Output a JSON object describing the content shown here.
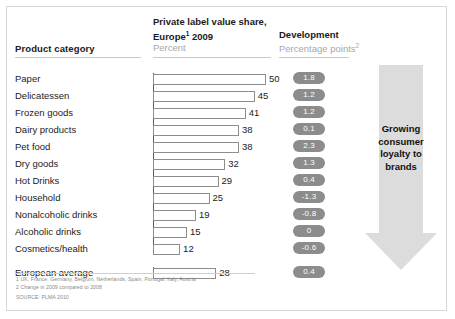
{
  "header": {
    "category_label": "Product category",
    "share_title": "Private label value share,\nEurope",
    "share_title_line1": "Private label value share,",
    "share_title_line2": "Europe",
    "share_title_sup": "1",
    "share_title_year": " 2009",
    "share_subtitle": "Percent",
    "development_title": "Development",
    "development_subtitle": "Percentage points",
    "development_sup": "2"
  },
  "arrow": {
    "label": "Growing consumer loyalty to brands",
    "line1": "Growing",
    "line2": "consumer",
    "line3": "loyalty to",
    "line4": "brands",
    "color": "#dcdcdc"
  },
  "footnotes": {
    "note1": "1 UK, France, Germany, Belgium, Netherlands, Spain, Portugal, Italy, Austria",
    "note2": "2 Change in 2009 compared to 2008",
    "source": "SOURCE: PLMA 2010"
  },
  "style": {
    "pill_color": "#8c8c8c",
    "pill_text_color": "#ffffff",
    "bar_border_color": "#8d8d8d",
    "frame_border_color": "#d8d8d8"
  },
  "chart_data": {
    "type": "bar",
    "xlabel": "Percent",
    "ylabel": "Product category",
    "xlim": [
      0,
      50
    ],
    "grid": false,
    "legend": "none",
    "orientation": "horizontal",
    "categories": [
      "Paper",
      "Delicatessen",
      "Frozen goods",
      "Dairy products",
      "Pet food",
      "Dry goods",
      "Hot Drinks",
      "Household",
      "Nonalcoholic drinks",
      "Alcoholic drinks",
      "Cosmetics/health",
      "European average"
    ],
    "values": [
      50,
      45,
      41,
      38,
      38,
      32,
      29,
      25,
      19,
      15,
      12,
      28
    ],
    "series": [
      {
        "name": "Private label value share, Europe 2009 (Percent)",
        "values": [
          50,
          45,
          41,
          38,
          38,
          32,
          29,
          25,
          19,
          15,
          12,
          28
        ]
      },
      {
        "name": "Development (Percentage points)",
        "values": [
          1.8,
          1.2,
          1.2,
          0.1,
          2.3,
          1.3,
          0.4,
          -1.3,
          -0.8,
          0,
          -0.6,
          0.4
        ]
      }
    ],
    "development_labels": [
      "1.8",
      "1.2",
      "1.2",
      "0.1",
      "2.3",
      "1.3",
      "0.4",
      "-1.3",
      "-0.8",
      "0",
      "-0.6",
      "0.4"
    ],
    "annotations": [
      "Growing consumer loyalty to brands"
    ]
  }
}
